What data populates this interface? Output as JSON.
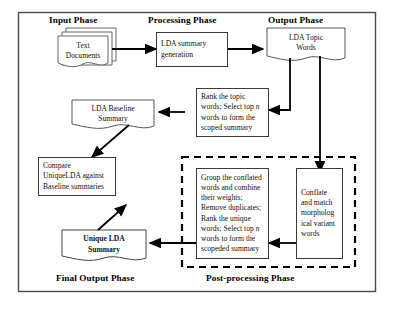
{
  "diagram": {
    "phases": [
      {
        "id": "input",
        "label": "Input Phase"
      },
      {
        "id": "processing",
        "label": "Processing Phase"
      },
      {
        "id": "output",
        "label": "Output Phase"
      },
      {
        "id": "final_output",
        "label": "Final Output Phase"
      },
      {
        "id": "post_processing",
        "label": "Post-processing Phase"
      }
    ],
    "nodes": {
      "text_documents": {
        "shape": "stacked-document",
        "lines": [
          "Text",
          "Documents"
        ]
      },
      "lda_summary_generation": {
        "shape": "rectangle",
        "lines": [
          "LDA summary",
          "generation"
        ]
      },
      "lda_topic_words": {
        "shape": "document",
        "lines": [
          "LDA Topic",
          "Words"
        ]
      },
      "rank_topic_words": {
        "shape": "rectangle",
        "lines": [
          "Rank the topic",
          "words; Select top n",
          "words to form the",
          "scoped summary"
        ],
        "italic_token": "n"
      },
      "lda_baseline_summary": {
        "shape": "document",
        "lines": [
          "LDA Baseline",
          "Summary"
        ]
      },
      "compare_summaries": {
        "shape": "rectangle",
        "lines": [
          "Compare",
          "UniqueLDA against",
          "Baseline summaries"
        ]
      },
      "unique_lda_summary": {
        "shape": "document",
        "lines": [
          "Unique LDA",
          "Summary"
        ],
        "bold": true
      },
      "group_conflated_words": {
        "shape": "rectangle",
        "lines": [
          "Group the conflated",
          "words and combine",
          "their weights;",
          "Remove duplicates;",
          "Rank the unique",
          "words; Select top n",
          "words to form the",
          "scopeded summary"
        ],
        "italic_token": "n"
      },
      "conflate_match": {
        "shape": "rectangle",
        "lines": [
          "Conflate",
          "and match",
          "morpholog",
          "ical variant",
          "words"
        ]
      }
    },
    "groups": {
      "post_processing_dashed": {
        "style": "dashed"
      },
      "outer_border": {
        "style": "solid"
      }
    },
    "colors": {
      "stroke": "#333333",
      "arrow": "#000000",
      "background": "#ffffff",
      "dashed_border": "#000000"
    }
  }
}
